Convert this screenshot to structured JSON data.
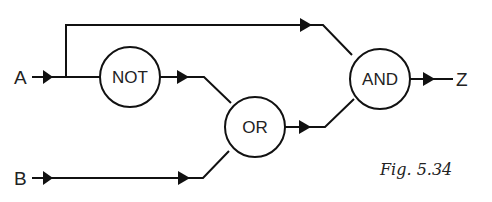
{
  "diagram": {
    "type": "logic-circuit",
    "inputs": [
      {
        "id": "A",
        "label": "A"
      },
      {
        "id": "B",
        "label": "B"
      }
    ],
    "outputs": [
      {
        "id": "Z",
        "label": "Z"
      }
    ],
    "gates": [
      {
        "id": "not",
        "label": "NOT",
        "inputs": [
          "A"
        ]
      },
      {
        "id": "or",
        "label": "OR",
        "inputs": [
          "NOT",
          "B"
        ]
      },
      {
        "id": "and",
        "label": "AND",
        "inputs": [
          "A",
          "OR"
        ]
      }
    ],
    "connections": [
      {
        "from": "A",
        "to": "NOT"
      },
      {
        "from": "A",
        "to": "AND"
      },
      {
        "from": "NOT",
        "to": "OR"
      },
      {
        "from": "B",
        "to": "OR"
      },
      {
        "from": "OR",
        "to": "AND"
      },
      {
        "from": "AND",
        "to": "Z"
      }
    ],
    "caption": "Fig. 5.34"
  }
}
